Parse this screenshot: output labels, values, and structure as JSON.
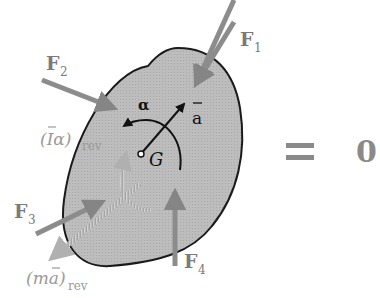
{
  "diagram": {
    "body": {
      "label_center": "G",
      "fill": "#b5b5b5",
      "outline": "#1a1a1a"
    },
    "forces": [
      {
        "id": "F1",
        "label": "F",
        "sub": "1"
      },
      {
        "id": "F2",
        "label": "F",
        "sub": "2"
      },
      {
        "id": "F3",
        "label": "F",
        "sub": "3"
      },
      {
        "id": "F4",
        "label": "F",
        "sub": "4"
      }
    ],
    "kinematics": {
      "alpha_label": "α",
      "a_bar_label": "a",
      "I_alpha_rev": {
        "main": "(Iα)",
        "sub": "rev"
      },
      "m_a_rev": {
        "main": "(ma)",
        "sub": "rev"
      }
    },
    "equation": {
      "equals": "=",
      "rhs": "0"
    },
    "colors": {
      "force_arrow": "#8c8c8c",
      "label_gray": "#7a7a7a",
      "kinematic_arrow": "#111111",
      "reversed_vector": "#9a9a9a",
      "equals_sign": "#8a8a8a"
    }
  }
}
